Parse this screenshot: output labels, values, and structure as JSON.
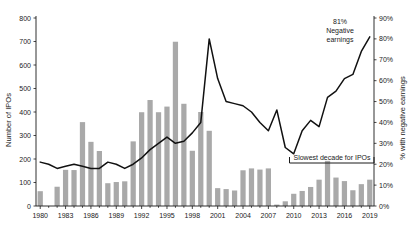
{
  "chart_data": {
    "type": "bar",
    "title": "",
    "xlabel": "",
    "ylabel": "Number of IPOs",
    "y2label": "% with negative earnings",
    "ylim": [
      0,
      800
    ],
    "y2lim": [
      0,
      90
    ],
    "grid": false,
    "legend": "none",
    "x": [
      1980,
      1981,
      1982,
      1983,
      1984,
      1985,
      1986,
      1987,
      1988,
      1989,
      1990,
      1991,
      1992,
      1993,
      1994,
      1995,
      1996,
      1997,
      1998,
      1999,
      2000,
      2001,
      2002,
      2003,
      2004,
      2005,
      2006,
      2007,
      2008,
      2009,
      2010,
      2011,
      2012,
      2013,
      2014,
      2015,
      2016,
      2017,
      2018,
      2019
    ],
    "xtick_labels": [
      "1980",
      "1983",
      "1986",
      "1989",
      "1992",
      "1995",
      "1998",
      "2001",
      "2004",
      "2007",
      "2010",
      "2013",
      "2016",
      "2019"
    ],
    "xticks": [
      1980,
      1983,
      1986,
      1989,
      1992,
      1995,
      1998,
      2001,
      2004,
      2007,
      2010,
      2013,
      2016,
      2019
    ],
    "ytick_labels": [
      "0",
      "100",
      "200",
      "300",
      "400",
      "500",
      "600",
      "700",
      "800"
    ],
    "yticks": [
      0,
      100,
      200,
      300,
      400,
      500,
      600,
      700,
      800
    ],
    "y2tick_labels": [
      "0%",
      "10%",
      "20%",
      "30%",
      "40%",
      "50%",
      "60%",
      "70%",
      "80%",
      "90%"
    ],
    "y2ticks": [
      0,
      10,
      20,
      30,
      40,
      50,
      60,
      70,
      80,
      90
    ],
    "series": [
      {
        "name": "Number of IPOs",
        "type": "bar",
        "axis": "left",
        "color": "#a9a9a9",
        "values": [
          63,
          0,
          82,
          154,
          153,
          357,
          273,
          234,
          97,
          102,
          105,
          275,
          399,
          451,
          399,
          423,
          699,
          435,
          235,
          400,
          320,
          76,
          72,
          66,
          152,
          160,
          155,
          160,
          6,
          20,
          52,
          64,
          81,
          112,
          192,
          121,
          106,
          67,
          93,
          112
        ]
      },
      {
        "name": "% with negative earnings",
        "type": "line",
        "axis": "right",
        "color": "#111111",
        "values": [
          21,
          20,
          18,
          19,
          20,
          19,
          18,
          18,
          21,
          20,
          18,
          20,
          23,
          27,
          30,
          33,
          30,
          31,
          35,
          40,
          80,
          61,
          50,
          49,
          48,
          45,
          40,
          36,
          46,
          28,
          25,
          36,
          41,
          38,
          52,
          55,
          61,
          63,
          74,
          81
        ]
      }
    ],
    "annotations": [
      {
        "id": "negative-earnings-callout",
        "text_line1": "81%",
        "text_line2": "Negative",
        "text_line3": "earnings"
      },
      {
        "id": "slowest-decade-bracket",
        "text": "Slowest decade for IPOs",
        "start_year": 2010,
        "end_year": 2019
      }
    ]
  }
}
